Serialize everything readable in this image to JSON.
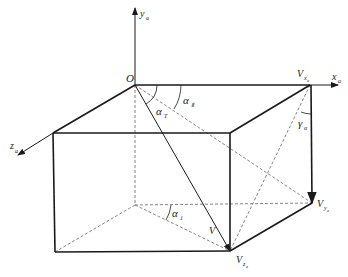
{
  "diagram": {
    "type": "3d-velocity-decomposition-box",
    "colors": {
      "line": "#1a1a1a",
      "dashed": "#555555",
      "background": "#ffffff"
    },
    "labels": {
      "origin": "O",
      "axis_y": {
        "main": "y",
        "sub": "a"
      },
      "axis_x": {
        "main": "x",
        "sub": "a"
      },
      "axis_z": {
        "main": "z",
        "sub": "a"
      },
      "vx": {
        "main": "V",
        "sub": "x",
        "subsub": "a"
      },
      "vy": {
        "main": "V",
        "sub": "y",
        "subsub": "a"
      },
      "vz": {
        "main": "V",
        "sub": "z",
        "subsub": "a"
      },
      "v": "V",
      "alpha_II": {
        "main": "α",
        "sub": "Ⅱ"
      },
      "alpha_T": {
        "main": "α",
        "sub": "T"
      },
      "alpha_I": {
        "main": "α",
        "sub": "1"
      },
      "gamma_a": {
        "main": "γ",
        "sub": "α"
      }
    }
  }
}
